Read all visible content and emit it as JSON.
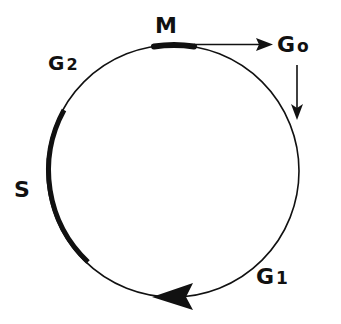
{
  "diagram": {
    "type": "cycle",
    "colors": {
      "ink": "#111111",
      "background": "#ffffff"
    },
    "phases": [
      {
        "id": "M",
        "label": "M",
        "sub": "",
        "emphasis": "thick-segment",
        "position": "top"
      },
      {
        "id": "G1",
        "label": "G",
        "sub": "1",
        "emphasis": "thin",
        "position": "bottom-right"
      },
      {
        "id": "S",
        "label": "S",
        "sub": "",
        "emphasis": "thick-segment",
        "position": "left"
      },
      {
        "id": "G2",
        "label": "G",
        "sub": "2",
        "emphasis": "thin",
        "position": "upper-left"
      },
      {
        "id": "G0",
        "label": "G",
        "sub": "o",
        "emphasis": "exit-state",
        "position": "upper-right"
      }
    ],
    "arrows": [
      {
        "from": "M",
        "to": "G0",
        "style": "straight-horizontal"
      },
      {
        "from": "G0",
        "to": "G1",
        "style": "straight-vertical"
      },
      {
        "from": "G1",
        "to": "S",
        "style": "arrowhead-on-circle",
        "direction": "clockwise"
      }
    ]
  }
}
